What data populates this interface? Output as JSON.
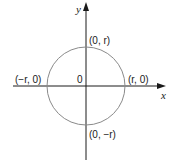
{
  "diagram": {
    "axes": {
      "x_label": "x",
      "y_label": "y",
      "origin_label": "0"
    },
    "points": {
      "top": "(0, r)",
      "bottom": "(0, −r)",
      "left": "(−r, 0)",
      "right": "(r, 0)"
    },
    "colors": {
      "axis": "#1a1a1a",
      "circle": "#8a8a8a",
      "text": "#1a1a1a"
    }
  }
}
